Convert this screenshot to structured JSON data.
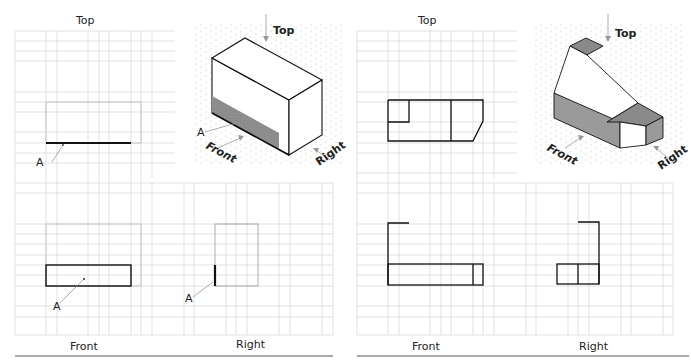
{
  "exercise_1": {
    "view_labels": {
      "top": "Top",
      "front": "Front",
      "right": "Right"
    },
    "point_label": "A",
    "iso": {
      "top": "Top",
      "front": "Front",
      "right": "Right",
      "point_label": "A"
    }
  },
  "exercise_2": {
    "view_labels": {
      "top": "Top",
      "front": "Front",
      "right": "Right"
    },
    "iso": {
      "top": "Top",
      "front": "Front",
      "right": "Right"
    }
  },
  "colors": {
    "grid": "#cfcfcf",
    "line": "#111111",
    "shade": "#9a9a9a",
    "iso_dots": "#bbbbbb"
  }
}
